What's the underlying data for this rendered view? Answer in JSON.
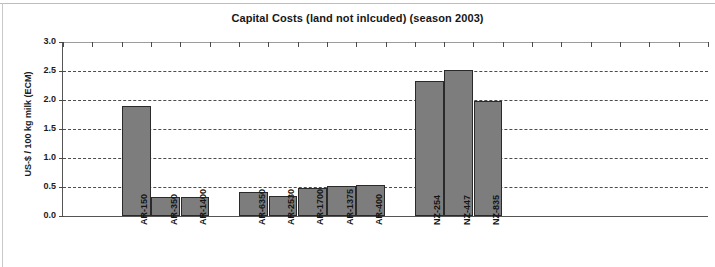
{
  "chart_data": {
    "type": "bar",
    "title": "Capital Costs (land not inlcuded) (season 2003)",
    "xlabel": "",
    "ylabel": "US-$ / 100 kg milk (ECM)",
    "ylim": [
      0.0,
      3.0
    ],
    "ytick_labels": [
      "0.0",
      "0.5",
      "1.0",
      "1.5",
      "2.0",
      "2.5",
      "3.0"
    ],
    "ytick_values": [
      0.0,
      0.5,
      1.0,
      1.5,
      2.0,
      2.5,
      3.0
    ],
    "grid": "horizontal-dashed",
    "legend": "none",
    "bar_color": "#7d7d7d",
    "bar_edge_color": "#2a2a2a",
    "categories": [
      "AR-150",
      "AR-350",
      "AR-1400",
      "",
      "AR-6350",
      "AR-2530",
      "AR-1700",
      "AR-1375",
      "AR-400",
      "",
      "NZ-254",
      "NZ-447",
      "NZ-835"
    ],
    "values": [
      1.9,
      0.33,
      0.32,
      null,
      0.41,
      0.35,
      0.48,
      0.51,
      0.54,
      null,
      2.33,
      2.52,
      1.98
    ],
    "bars": [
      {
        "label": "AR-150",
        "value": 1.9,
        "slot": 2
      },
      {
        "label": "AR-350",
        "value": 0.33,
        "slot": 3
      },
      {
        "label": "AR-1400",
        "value": 0.32,
        "slot": 4
      },
      {
        "label": "AR-6350",
        "value": 0.41,
        "slot": 6
      },
      {
        "label": "AR-2530",
        "value": 0.35,
        "slot": 7
      },
      {
        "label": "AR-1700",
        "value": 0.48,
        "slot": 8
      },
      {
        "label": "AR-1375",
        "value": 0.51,
        "slot": 9
      },
      {
        "label": "AR-400",
        "value": 0.54,
        "slot": 10
      },
      {
        "label": "NZ-254",
        "value": 2.33,
        "slot": 12
      },
      {
        "label": "NZ-447",
        "value": 2.52,
        "slot": 13
      },
      {
        "label": "NZ-835",
        "value": 1.98,
        "slot": 14
      }
    ],
    "total_slots": 22
  }
}
